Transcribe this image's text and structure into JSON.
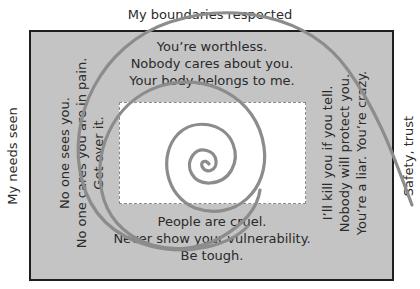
{
  "diagram": {
    "outer_labels": {
      "top": "My boundaries respected",
      "left": "My needs seen",
      "right": "Safety, trust"
    },
    "messages": {
      "top": [
        "You’re worthless.",
        "Nobody cares about you.",
        "Your body belongs to me."
      ],
      "left": [
        "No one sees you.",
        "No one cares you are in pain.",
        "Get over it."
      ],
      "right": [
        "I’ll kill you if you tell.",
        "Nobody will protect you.",
        "You’re a liar. You’re crazy."
      ],
      "bottom": [
        "People are cruel.",
        "Never show your vulnerability.",
        "Be tough."
      ]
    },
    "colors": {
      "outer_box_fill": "#c4c4c4",
      "outer_box_border": "#1e1e1e",
      "inner_box_fill": "#ffffff",
      "spiral_stroke": "#8c8c8c",
      "text": "#2a2a2a"
    }
  }
}
